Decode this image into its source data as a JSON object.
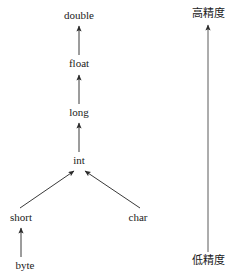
{
  "diagram": {
    "background_color": "#ffffff",
    "line_color": "#333333",
    "text_color": "#1a1a1a",
    "nodes": [
      {
        "id": "double",
        "label": "double"
      },
      {
        "id": "float",
        "label": "float"
      },
      {
        "id": "long",
        "label": "long"
      },
      {
        "id": "int",
        "label": "int"
      },
      {
        "id": "short",
        "label": "short"
      },
      {
        "id": "char",
        "label": "char"
      },
      {
        "id": "byte",
        "label": "byte"
      }
    ],
    "edges": [
      {
        "from": "float",
        "to": "double"
      },
      {
        "from": "long",
        "to": "float"
      },
      {
        "from": "int",
        "to": "long"
      },
      {
        "from": "short",
        "to": "int"
      },
      {
        "from": "char",
        "to": "int"
      },
      {
        "from": "byte",
        "to": "short"
      }
    ],
    "axis": {
      "top_label": "高精度",
      "bottom_label": "低精度",
      "direction": "upward"
    }
  }
}
